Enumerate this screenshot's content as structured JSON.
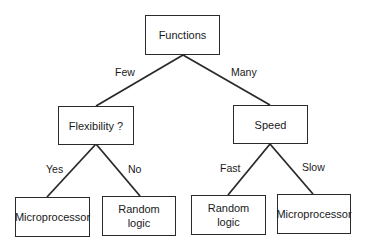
{
  "diagram": {
    "type": "decision-tree",
    "root": {
      "label": "Functions"
    },
    "level1": [
      {
        "edge": "Few",
        "label": "Flexibility ?"
      },
      {
        "edge": "Many",
        "label": "Speed"
      }
    ],
    "leaves": [
      {
        "parent": "Flexibility ?",
        "edge": "Yes",
        "label": "Microprocessor"
      },
      {
        "parent": "Flexibility ?",
        "edge": "No",
        "label": "Random\nlogic"
      },
      {
        "parent": "Speed",
        "edge": "Fast",
        "label": "Random\nlogic"
      },
      {
        "parent": "Speed",
        "edge": "Slow",
        "label": "Microprocessor"
      }
    ],
    "colors": {
      "line": "#2a2a2a",
      "text": "#1a1a1a",
      "background": "#ffffff"
    }
  }
}
